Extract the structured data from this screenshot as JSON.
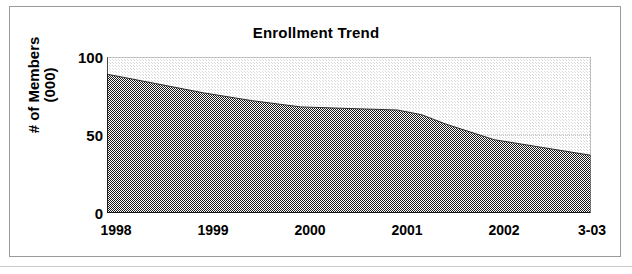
{
  "chart_data": {
    "type": "area",
    "title": "Enrollment Trend",
    "xlabel": "",
    "ylabel": "# of Members\n(000)",
    "ylabel_line1": "# of Members",
    "ylabel_line2": "(000)",
    "categories": [
      "1998",
      "1999",
      "2000",
      "2001",
      "2002",
      "3-03"
    ],
    "x_tick_labels": [
      "1998",
      "1999",
      "2000",
      "2001",
      "2002",
      "3-03"
    ],
    "y_tick_labels": [
      "0",
      "50",
      "100"
    ],
    "y_ticks": [
      0,
      50,
      100
    ],
    "y_minor_ticks": [
      25,
      75
    ],
    "ylim": [
      0,
      100
    ],
    "grid": "horizontal-gridline-at-50",
    "legend": "none",
    "series": [
      {
        "name": "# of Members (000)",
        "values": [
          89,
          77,
          68,
          66,
          47,
          37
        ],
        "points": [
          {
            "x": "1998",
            "y": 89
          },
          {
            "x": "1998.5",
            "y": 83
          },
          {
            "x": "1999",
            "y": 77
          },
          {
            "x": "1999.5",
            "y": 72
          },
          {
            "x": "2000",
            "y": 68
          },
          {
            "x": "2000.5",
            "y": 67
          },
          {
            "x": "2001",
            "y": 66
          },
          {
            "x": "2001.25",
            "y": 63
          },
          {
            "x": "2001.5",
            "y": 57
          },
          {
            "x": "2002",
            "y": 47
          },
          {
            "x": "2002.5",
            "y": 42
          },
          {
            "x": "3-03",
            "y": 37
          }
        ]
      }
    ],
    "fill_color": "#4a4a4a",
    "plot_background": "#f1f1f1",
    "axis_color": "#000000"
  },
  "colors": {
    "frame_border": "#9a9a9a",
    "text": "#000000",
    "area_fill": "#4a4a4a",
    "plot_bg": "#f1f1f1",
    "gridline": "#b8b8b8"
  }
}
